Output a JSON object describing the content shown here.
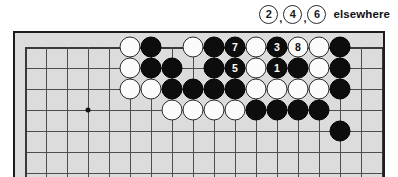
{
  "caption": {
    "stones": [
      "2",
      "4",
      "6"
    ],
    "separator": ",",
    "text": "elsewhere"
  },
  "board": {
    "columns": 18,
    "rows": 6,
    "spacing": 21,
    "origin_x": 10,
    "origin_y": 14,
    "star_points": [
      {
        "col": 3,
        "row": 3
      }
    ],
    "background_color": "#dcdcdc",
    "line_color": "#4d4d4d",
    "border_color": "#1c1c1c"
  },
  "stones": [
    {
      "col": 6,
      "row": 0,
      "color": "black",
      "label": ""
    },
    {
      "col": 5,
      "row": 0,
      "color": "white",
      "label": ""
    },
    {
      "col": 8,
      "row": 0,
      "color": "white",
      "label": ""
    },
    {
      "col": 9,
      "row": 0,
      "color": "black",
      "label": ""
    },
    {
      "col": 10,
      "row": 0,
      "color": "black",
      "label": "7"
    },
    {
      "col": 11,
      "row": 0,
      "color": "white",
      "label": ""
    },
    {
      "col": 12,
      "row": 0,
      "color": "black",
      "label": "3"
    },
    {
      "col": 13,
      "row": 0,
      "color": "white",
      "label": "8"
    },
    {
      "col": 14,
      "row": 0,
      "color": "white",
      "label": ""
    },
    {
      "col": 15,
      "row": 0,
      "color": "black",
      "label": ""
    },
    {
      "col": 5,
      "row": 1,
      "color": "white",
      "label": ""
    },
    {
      "col": 6,
      "row": 1,
      "color": "black",
      "label": ""
    },
    {
      "col": 7,
      "row": 1,
      "color": "black",
      "label": ""
    },
    {
      "col": 9,
      "row": 1,
      "color": "black",
      "label": ""
    },
    {
      "col": 10,
      "row": 1,
      "color": "black",
      "label": "5"
    },
    {
      "col": 11,
      "row": 1,
      "color": "white",
      "label": ""
    },
    {
      "col": 12,
      "row": 1,
      "color": "black",
      "label": "1"
    },
    {
      "col": 13,
      "row": 1,
      "color": "black",
      "label": ""
    },
    {
      "col": 14,
      "row": 1,
      "color": "white",
      "label": ""
    },
    {
      "col": 15,
      "row": 1,
      "color": "black",
      "label": ""
    },
    {
      "col": 5,
      "row": 2,
      "color": "white",
      "label": ""
    },
    {
      "col": 6,
      "row": 2,
      "color": "white",
      "label": ""
    },
    {
      "col": 7,
      "row": 2,
      "color": "black",
      "label": ""
    },
    {
      "col": 8,
      "row": 2,
      "color": "black",
      "label": ""
    },
    {
      "col": 9,
      "row": 2,
      "color": "black",
      "label": ""
    },
    {
      "col": 10,
      "row": 2,
      "color": "black",
      "label": ""
    },
    {
      "col": 11,
      "row": 2,
      "color": "white",
      "label": ""
    },
    {
      "col": 12,
      "row": 2,
      "color": "white",
      "label": ""
    },
    {
      "col": 13,
      "row": 2,
      "color": "white",
      "label": ""
    },
    {
      "col": 14,
      "row": 2,
      "color": "white",
      "label": ""
    },
    {
      "col": 15,
      "row": 2,
      "color": "black",
      "label": ""
    },
    {
      "col": 7,
      "row": 3,
      "color": "white",
      "label": ""
    },
    {
      "col": 8,
      "row": 3,
      "color": "white",
      "label": ""
    },
    {
      "col": 9,
      "row": 3,
      "color": "white",
      "label": ""
    },
    {
      "col": 10,
      "row": 3,
      "color": "white",
      "label": ""
    },
    {
      "col": 11,
      "row": 3,
      "color": "black",
      "label": ""
    },
    {
      "col": 12,
      "row": 3,
      "color": "black",
      "label": ""
    },
    {
      "col": 13,
      "row": 3,
      "color": "black",
      "label": ""
    },
    {
      "col": 14,
      "row": 3,
      "color": "black",
      "label": ""
    },
    {
      "col": 15,
      "row": 4,
      "color": "black",
      "label": ""
    }
  ]
}
